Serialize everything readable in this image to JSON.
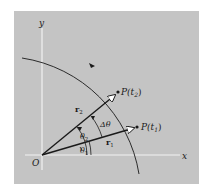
{
  "figure": {
    "background_color": "#c4c4c4",
    "axes": {
      "x_label": "x",
      "y_label": "y",
      "origin_label": "O"
    },
    "points": [
      {
        "id": "p1",
        "label": "P(t",
        "sub": "1",
        "close": ")"
      },
      {
        "id": "p2",
        "label": "P(t",
        "sub": "2",
        "close": ")"
      }
    ],
    "vectors": [
      {
        "id": "r1",
        "label": "r",
        "sub": "1"
      },
      {
        "id": "r2",
        "label": "r",
        "sub": "2"
      }
    ],
    "angles": [
      {
        "id": "theta1",
        "label": "θ",
        "sub": "1"
      },
      {
        "id": "theta2",
        "label": "θ",
        "sub": "2"
      },
      {
        "id": "delta_theta",
        "label": "Δθ"
      }
    ],
    "path_direction": "counterclockwise"
  }
}
